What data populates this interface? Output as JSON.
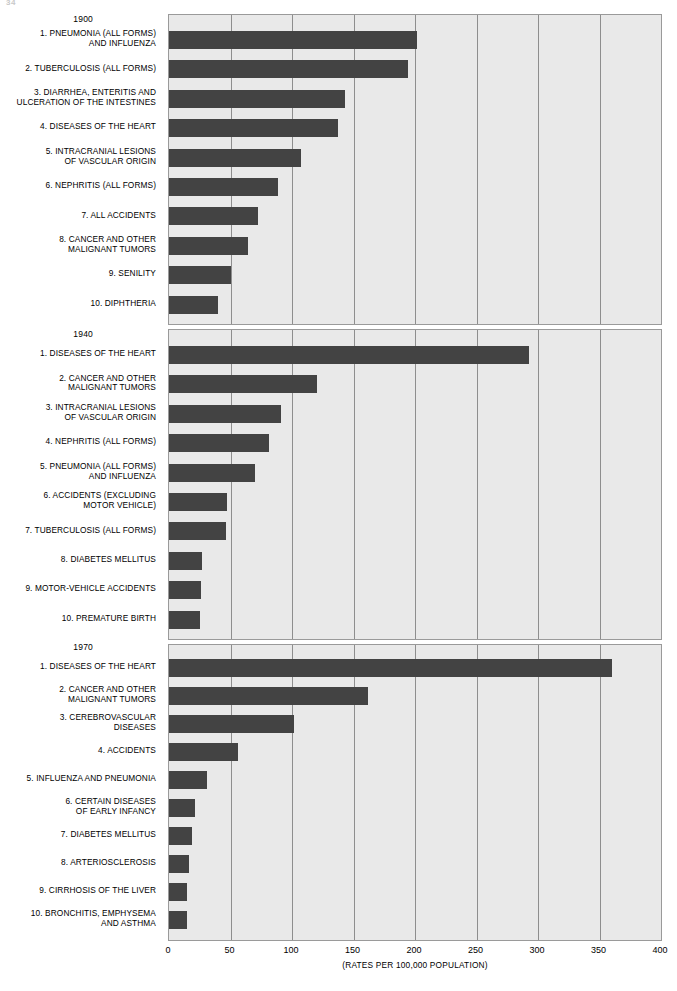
{
  "page": {
    "header_number": "34",
    "header_text": "(partial cut-off running head)"
  },
  "axis": {
    "ticks": [
      0,
      50,
      100,
      150,
      200,
      250,
      300,
      350,
      400
    ],
    "tick_labels": [
      "0",
      "50",
      "100",
      "150",
      "200",
      "250",
      "300",
      "350",
      "400"
    ],
    "caption": "(RATES PER 100,000 POPULATION)"
  },
  "colors": {
    "bar": "#434343",
    "panel_background": "#e9e9e9",
    "gridline": "#8e8e8e",
    "panel_border": "#9a9a9a"
  },
  "chart_data": {
    "type": "bar",
    "xlabel": "(RATES PER 100,000 POPULATION)",
    "ylabel": "",
    "xlim": [
      0,
      400
    ],
    "grid": true,
    "orientation": "horizontal",
    "legend": "none",
    "panels": [
      {
        "year": "1900",
        "categories": [
          "1.  PNEUMONIA (ALL FORMS)\nAND INFLUENZA",
          "2.  TUBERCULOSIS (ALL FORMS)",
          "3.  DIARRHEA, ENTERITIS AND\nULCERATION OF THE INTESTINES",
          "4.  DISEASES OF THE HEART",
          "5.  INTRACRANIAL LESIONS\nOF VASCULAR ORIGIN",
          "6.  NEPHRITIS (ALL FORMS)",
          "7.  ALL ACCIDENTS",
          "8.  CANCER AND OTHER\nMALIGNANT TUMORS",
          "9.  SENILITY",
          "10.  DIPHTHERIA"
        ],
        "values": [
          202,
          194,
          143,
          137,
          107,
          89,
          72,
          64,
          50,
          40
        ]
      },
      {
        "year": "1940",
        "categories": [
          "1.  DISEASES OF THE HEART",
          "2.  CANCER AND OTHER\nMALIGNANT TUMORS",
          "3.  INTRACRANIAL LESIONS\nOF VASCULAR ORIGIN",
          "4.  NEPHRITIS (ALL FORMS)",
          "5.  PNEUMONIA (ALL FORMS)\nAND INFLUENZA",
          "6.  ACCIDENTS (EXCLUDING\nMOTOR VEHICLE)",
          "7.  TUBERCULOSIS (ALL FORMS)",
          "8.  DIABETES MELLITUS",
          "9.  MOTOR-VEHICLE ACCIDENTS",
          "10.  PREMATURE BIRTH"
        ],
        "values": [
          293,
          120,
          91,
          81,
          70,
          47,
          46,
          27,
          26,
          25
        ]
      },
      {
        "year": "1970",
        "categories": [
          "1.  DISEASES OF THE HEART",
          "2.  CANCER AND OTHER\nMALIGNANT TUMORS",
          "3.  CEREBROVASCULAR\nDISEASES",
          "4.  ACCIDENTS",
          "5.  INFLUENZA AND PNEUMONIA",
          "6.  CERTAIN DISEASES\nOF EARLY INFANCY",
          "7.  DIABETES MELLITUS",
          "8.  ARTERIOSCLEROSIS",
          "9.  CIRRHOSIS OF THE LIVER",
          "10.  BRONCHITIS, EMPHYSEMA\nAND ASTHMA"
        ],
        "values": [
          360,
          162,
          102,
          56,
          31,
          21,
          19,
          16,
          15,
          15
        ]
      }
    ]
  }
}
